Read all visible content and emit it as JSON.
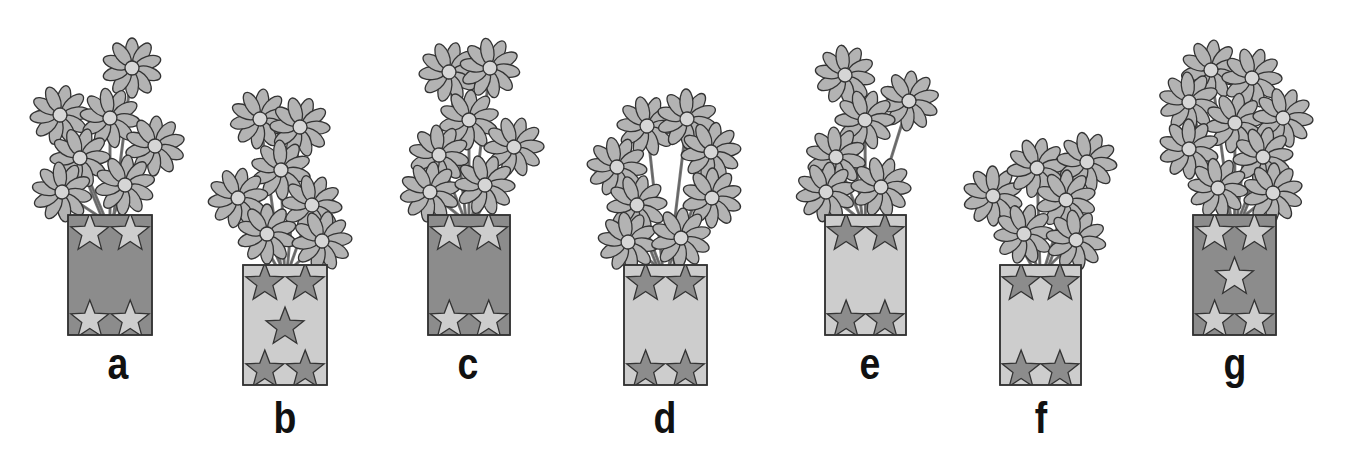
{
  "figure": {
    "colors": {
      "dark_fill": "#8c8c8c",
      "light_fill": "#cdcdcd",
      "petal": "#b3b3b3",
      "center": "#d6d6d6",
      "stroke": "#333333",
      "stem": "#777777"
    },
    "vases": [
      {
        "label": "a",
        "vase_color": "dark",
        "star_color": "light",
        "stars": 4,
        "flowers": 7,
        "x": 68,
        "y": 215,
        "w": 84,
        "h": 120,
        "flower_pos": [
          [
            132,
            68
          ],
          [
            60,
            115
          ],
          [
            110,
            118
          ],
          [
            155,
            146
          ],
          [
            80,
            158
          ],
          [
            62,
            192
          ],
          [
            125,
            185
          ]
        ],
        "label_x": 98,
        "label_y": 344
      },
      {
        "label": "b",
        "vase_color": "light",
        "star_color": "dark",
        "stars": 5,
        "flowers": 7,
        "x": 243,
        "y": 265,
        "w": 84,
        "h": 120,
        "flower_pos": [
          [
            260,
            119
          ],
          [
            300,
            127
          ],
          [
            281,
            170
          ],
          [
            238,
            198
          ],
          [
            312,
            205
          ],
          [
            267,
            234
          ],
          [
            322,
            241
          ]
        ],
        "label_x": 266,
        "label_y": 398
      },
      {
        "label": "c",
        "vase_color": "dark",
        "star_color": "light",
        "stars": 4,
        "flowers": 7,
        "x": 428,
        "y": 215,
        "w": 82,
        "h": 120,
        "flower_pos": [
          [
            449,
            72
          ],
          [
            490,
            68
          ],
          [
            469,
            120
          ],
          [
            514,
            147
          ],
          [
            439,
            155
          ],
          [
            430,
            192
          ],
          [
            485,
            185
          ]
        ],
        "label_x": 448,
        "label_y": 344
      },
      {
        "label": "d",
        "vase_color": "light",
        "star_color": "dark",
        "stars": 4,
        "flowers": 8,
        "x": 624,
        "y": 265,
        "w": 83,
        "h": 120,
        "flower_pos": [
          [
            647,
            126
          ],
          [
            687,
            119
          ],
          [
            711,
            152
          ],
          [
            617,
            167
          ],
          [
            712,
            198
          ],
          [
            637,
            205
          ],
          [
            628,
            242
          ],
          [
            681,
            238
          ]
        ],
        "label_x": 645,
        "label_y": 398
      },
      {
        "label": "e",
        "vase_color": "light",
        "star_color": "dark",
        "stars": 4,
        "flowers": 6,
        "x": 825,
        "y": 215,
        "w": 81,
        "h": 120,
        "flower_pos": [
          [
            845,
            75
          ],
          [
            909,
            101
          ],
          [
            865,
            120
          ],
          [
            836,
            157
          ],
          [
            826,
            192
          ],
          [
            881,
            187
          ]
        ],
        "label_x": 850,
        "label_y": 344
      },
      {
        "label": "f",
        "vase_color": "light",
        "star_color": "dark",
        "stars": 4,
        "flowers": 6,
        "x": 1000,
        "y": 265,
        "w": 81,
        "h": 120,
        "flower_pos": [
          [
            993,
            196
          ],
          [
            1037,
            168
          ],
          [
            1087,
            162
          ],
          [
            1066,
            200
          ],
          [
            1024,
            234
          ],
          [
            1076,
            240
          ]
        ],
        "label_x": 1021,
        "label_y": 398
      },
      {
        "label": "g",
        "vase_color": "dark",
        "star_color": "light",
        "stars": 5,
        "flowers": 9,
        "x": 1193,
        "y": 215,
        "w": 83,
        "h": 120,
        "flower_pos": [
          [
            1211,
            70
          ],
          [
            1252,
            78
          ],
          [
            1189,
            102
          ],
          [
            1235,
            123
          ],
          [
            1283,
            118
          ],
          [
            1189,
            149
          ],
          [
            1263,
            157
          ],
          [
            1218,
            188
          ],
          [
            1273,
            193
          ]
        ],
        "label_x": 1215,
        "label_y": 344
      }
    ]
  }
}
